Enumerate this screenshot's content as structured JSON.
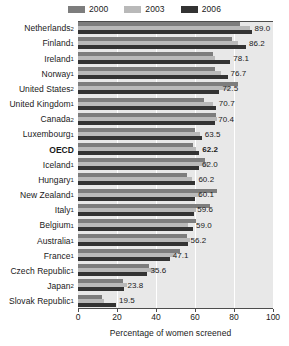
{
  "chart_data": {
    "type": "bar",
    "orientation": "horizontal",
    "title": "",
    "xlabel": "Percentage of women screened",
    "ylabel": "",
    "xlim": [
      0,
      100
    ],
    "xticks": [
      0,
      20,
      40,
      60,
      80,
      100
    ],
    "grid": true,
    "legend_position": "top-center",
    "legend": [
      {
        "name": "2000",
        "color": "#7d7d7d"
      },
      {
        "name": "2003",
        "color": "#b9b9b9"
      },
      {
        "name": "2006",
        "color": "#333333"
      }
    ],
    "series": [
      {
        "name": "2000",
        "color": "#7d7d7d",
        "values": [
          83.0,
          79.0,
          69.0,
          70.5,
          82.0,
          64.5,
          71.0,
          60.0,
          59.0,
          65.0,
          56.0,
          71.5,
          67.5,
          60.5,
          56.0,
          52.5,
          36.5,
          23.0,
          12.5
        ]
      },
      {
        "name": "2003",
        "color": "#b9b9b9",
        "values": [
          88.0,
          82.0,
          70.5,
          73.5,
          78.0,
          69.0,
          71.5,
          62.5,
          60.5,
          66.5,
          58.5,
          63.0,
          60.5,
          56.5,
          57.5,
          49.5,
          40.0,
          25.0,
          13.5
        ]
      },
      {
        "name": "2006",
        "color": "#333333",
        "values": [
          89.0,
          86.2,
          78.1,
          76.7,
          72.5,
          70.7,
          70.4,
          63.5,
          62.2,
          62.0,
          60.2,
          60.1,
          59.6,
          59.0,
          56.2,
          47.1,
          35.6,
          23.8,
          19.5
        ]
      }
    ],
    "categories": [
      {
        "label": "Netherlands",
        "note": "2",
        "value_label": "89.0",
        "highlight": false
      },
      {
        "label": "Finland",
        "note": "1",
        "value_label": "86.2",
        "highlight": false
      },
      {
        "label": "Ireland",
        "note": "1",
        "value_label": "78.1",
        "highlight": false
      },
      {
        "label": "Norway",
        "note": "1",
        "value_label": "76.7",
        "highlight": false
      },
      {
        "label": "United States",
        "note": "2",
        "value_label": "72.5",
        "highlight": false
      },
      {
        "label": "United Kingdom",
        "note": "1",
        "value_label": "70.7",
        "highlight": false
      },
      {
        "label": "Canada",
        "note": "2",
        "value_label": "70.4",
        "highlight": false
      },
      {
        "label": "Luxembourg",
        "note": "1",
        "value_label": "63.5",
        "highlight": false
      },
      {
        "label": "OECD",
        "note": "",
        "value_label": "62.2",
        "highlight": true
      },
      {
        "label": "Iceland",
        "note": "1",
        "value_label": "62.0",
        "highlight": false
      },
      {
        "label": "Hungary",
        "note": "1",
        "value_label": "60.2",
        "highlight": false
      },
      {
        "label": "New Zealand",
        "note": "1",
        "value_label": "60.1",
        "highlight": false
      },
      {
        "label": "Italy",
        "note": "1",
        "value_label": "59.6",
        "highlight": false
      },
      {
        "label": "Belgium",
        "note": "1",
        "value_label": "59.0",
        "highlight": false
      },
      {
        "label": "Australia",
        "note": "1",
        "value_label": "56.2",
        "highlight": false
      },
      {
        "label": "France",
        "note": "1",
        "value_label": "47.1",
        "highlight": false
      },
      {
        "label": "Czech Republic",
        "note": "1",
        "value_label": "35.6",
        "highlight": false
      },
      {
        "label": "Japan",
        "note": "2",
        "value_label": "23.8",
        "highlight": false
      },
      {
        "label": "Slovak Republic",
        "note": "1",
        "value_label": "19.5",
        "highlight": false
      }
    ]
  },
  "axis": {
    "tick_labels": [
      "0",
      "20",
      "40",
      "60",
      "80",
      "100"
    ],
    "xlabel": "Percentage of women screened"
  },
  "colors": {
    "plot_background": "#e8e8e8",
    "gridline": "#ffffff",
    "axis": "#4d4d4d",
    "text": "#1a1a1a"
  }
}
